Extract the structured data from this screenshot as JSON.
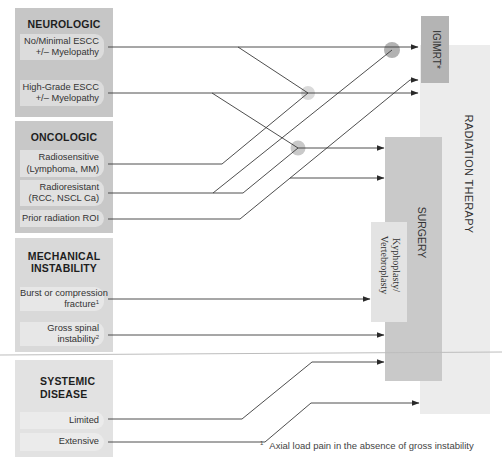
{
  "panels": {
    "neurologic": {
      "title": "NEUROLOGIC",
      "items": [
        {
          "line1": "No/Minimal ESCC",
          "line2": "+/– Myelopathy"
        },
        {
          "line1": "High-Grade ESCC",
          "line2": "+/– Myelopathy"
        }
      ]
    },
    "oncologic": {
      "title": "ONCOLOGIC",
      "items": [
        {
          "line1": "Radiosensitive",
          "line2": "(Lymphoma, MM)"
        },
        {
          "line1": "Radioresistant",
          "line2": "(RCC, NSCL Ca)"
        },
        {
          "line1": "Prior radiation ROI"
        }
      ]
    },
    "mechanical": {
      "title_line1": "MECHANICAL",
      "title_line2": "INSTABILITY",
      "items": [
        {
          "line1": "Burst or compression",
          "line2": "fracture",
          "sup": "1"
        },
        {
          "line1": "Gross spinal",
          "line2": "instability",
          "sup": "2"
        }
      ]
    },
    "systemic": {
      "title_line1": "SYSTEMIC",
      "title_line2": "DISEASE",
      "items": [
        {
          "line1": "Limited"
        },
        {
          "line1": "Extensive"
        }
      ]
    }
  },
  "treatments": {
    "igimrt": "IGIMRT*",
    "radiation_therapy": "RADIATION THERAPY",
    "surgery": "SURGERY",
    "kypho_line1": "Kyphoplasty/",
    "kypho_line2": "Vertebroplasty"
  },
  "footnote": {
    "marker": "1",
    "text": "Axial load pain in the absence of gross instability"
  },
  "colors": {
    "line": "#3a3a3a",
    "neurologic_panel": "#c6c6c6",
    "oncologic_panel": "#c8c8c8",
    "mechanical_panel": "#d9d9d9",
    "systemic_panel": "#e2e2e2",
    "igimrt_box": "#b4b4b4",
    "surgery_box": "#c9c9c9",
    "rt_box": "#ececec",
    "kypho_box": "#e3e3e3",
    "separator": "#bdbdbd"
  },
  "diagram": {
    "connections": [
      {
        "from": "no-minimal-escc",
        "to": "igimrt",
        "points": [
          [
            108,
            47
          ],
          [
            418,
            47
          ]
        ],
        "arrow": true
      },
      {
        "from": "no-minimal-escc",
        "to": "rt-junction",
        "points": [
          [
            238,
            47
          ],
          [
            308,
            93
          ]
        ],
        "arrow": false
      },
      {
        "from": "high-grade-escc",
        "to": "radiation-therapy",
        "points": [
          [
            108,
            93
          ],
          [
            418,
            93
          ]
        ],
        "arrow": true
      },
      {
        "from": "high-grade-escc",
        "to": "surgery-junction",
        "points": [
          [
            212,
            93
          ],
          [
            298,
            148
          ]
        ],
        "arrow": false
      },
      {
        "from": "radiosensitive",
        "to": "rt-junction",
        "points": [
          [
            108,
            164
          ],
          [
            222,
            164
          ],
          [
            308,
            93
          ]
        ],
        "arrow": false
      },
      {
        "from": "radioresistant",
        "to": "surgery-junction",
        "points": [
          [
            108,
            193
          ],
          [
            243,
            193
          ],
          [
            298,
            148
          ]
        ],
        "arrow": false
      },
      {
        "from": "radioresistant",
        "to": "igimrt-junction",
        "points": [
          [
            213,
            193
          ],
          [
            392,
            50
          ]
        ],
        "arrow": false
      },
      {
        "from": "prior-radiation",
        "to": "igimrt",
        "points": [
          [
            108,
            219
          ],
          [
            240,
            219
          ],
          [
            410,
            80
          ],
          [
            418,
            80
          ]
        ],
        "arrow": true
      },
      {
        "from": "prior-radiation",
        "to": "surgery",
        "points": [
          [
            290,
            178
          ],
          [
            384,
            178
          ]
        ],
        "arrow": true
      },
      {
        "from": "surgery-junction",
        "to": "surgery",
        "points": [
          [
            298,
            148
          ],
          [
            384,
            148
          ]
        ],
        "arrow": true
      },
      {
        "from": "burst-fracture",
        "to": "kyphoplasty",
        "points": [
          [
            108,
            299
          ],
          [
            370,
            299
          ]
        ],
        "arrow": true
      },
      {
        "from": "gross-spinal-instability",
        "to": "surgery",
        "points": [
          [
            108,
            335
          ],
          [
            384,
            335
          ]
        ],
        "arrow": true
      },
      {
        "from": "limited",
        "to": "surgery",
        "points": [
          [
            108,
            419
          ],
          [
            242,
            419
          ],
          [
            312,
            362
          ],
          [
            384,
            362
          ]
        ],
        "arrow": true
      },
      {
        "from": "extensive",
        "to": "radiation-therapy",
        "points": [
          [
            108,
            442
          ],
          [
            265,
            442
          ],
          [
            311,
            403
          ],
          [
            419,
            403
          ]
        ],
        "arrow": true
      }
    ],
    "junctions": [
      {
        "id": "igimrt-junction",
        "cx": 392,
        "cy": 50,
        "r": 8,
        "color": "#b2b2b2"
      },
      {
        "id": "rt-junction",
        "cx": 308,
        "cy": 93,
        "r": 7,
        "color": "#dadada"
      },
      {
        "id": "surgery-junction",
        "cx": 298,
        "cy": 148,
        "r": 7.5,
        "color": "#c9c9c9"
      }
    ],
    "separator": {
      "x1": 0,
      "y1": 355,
      "x2": 502,
      "y2": 352
    }
  }
}
